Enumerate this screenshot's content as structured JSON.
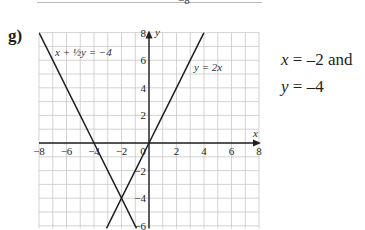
{
  "previous_graph_fragment": {
    "tick_label": "−8"
  },
  "part": {
    "label": "g)"
  },
  "answer": {
    "line1": {
      "var": "x",
      "rest": " = –2 and"
    },
    "line2": {
      "var": "y",
      "rest": " = –4"
    }
  },
  "chart_data": {
    "type": "line",
    "title": "",
    "xlabel": "x",
    "ylabel": "y",
    "xlim": [
      -8,
      8
    ],
    "ylim": [
      -6.2,
      8
    ],
    "grid": true,
    "grid_step": 1,
    "x_ticks": [
      -8,
      -6,
      -4,
      -2,
      0,
      2,
      4,
      6,
      8
    ],
    "x_tick_labels": [
      "−8",
      "−6",
      "−4",
      "−2",
      "0",
      "2",
      "4",
      "6",
      "8"
    ],
    "y_ticks": [
      -6,
      -4,
      -2,
      2,
      4,
      6,
      8
    ],
    "y_tick_labels": [
      "−6",
      "−4",
      "−2",
      "2",
      "4",
      "6",
      "8"
    ],
    "series": [
      {
        "name": "x + ½y = −4",
        "equation": "y = -2x - 8",
        "label_text": "x + ½y = −4",
        "points": [
          [
            -8,
            8
          ],
          [
            -7,
            6
          ],
          [
            -6,
            4
          ],
          [
            -5,
            2
          ],
          [
            -4,
            0
          ],
          [
            -3,
            -2
          ],
          [
            -2,
            -4
          ],
          [
            -1,
            -6
          ],
          [
            -0.9,
            -6.2
          ]
        ]
      },
      {
        "name": "y = 2x",
        "equation": "y = 2x",
        "label_text": "y = 2x",
        "points": [
          [
            -3.1,
            -6.2
          ],
          [
            -3,
            -6
          ],
          [
            -2,
            -4
          ],
          [
            -1,
            -2
          ],
          [
            0,
            0
          ],
          [
            1,
            2
          ],
          [
            2,
            4
          ],
          [
            3,
            6
          ],
          [
            4,
            8
          ]
        ]
      }
    ],
    "intersection": {
      "x": -2,
      "y": -4
    },
    "legend": "inline labels on lines"
  }
}
